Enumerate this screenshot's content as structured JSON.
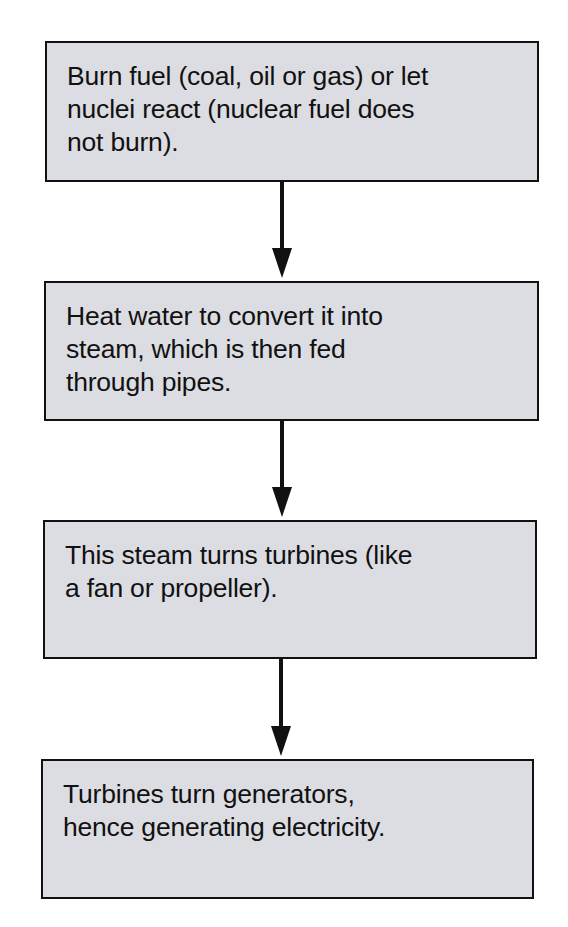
{
  "flowchart": {
    "colors": {
      "box_fill": "#dcdde2",
      "box_border": "#111111",
      "arrow": "#111111",
      "background": "#ffffff"
    },
    "steps": [
      {
        "lines": [
          "Burn fuel (coal, oil or gas) or let",
          "nuclei react (nuclear fuel does",
          "not burn)."
        ]
      },
      {
        "lines": [
          "Heat water to convert it into",
          "steam, which is then fed",
          "through pipes."
        ]
      },
      {
        "lines": [
          "This steam turns turbines (like",
          "a fan or propeller)."
        ]
      },
      {
        "lines": [
          "Turbines turn generators,",
          "hence generating electricity."
        ]
      }
    ],
    "arrows": [
      {
        "from": 0,
        "to": 1,
        "direction": "down"
      },
      {
        "from": 1,
        "to": 2,
        "direction": "down"
      },
      {
        "from": 2,
        "to": 3,
        "direction": "down"
      }
    ]
  }
}
